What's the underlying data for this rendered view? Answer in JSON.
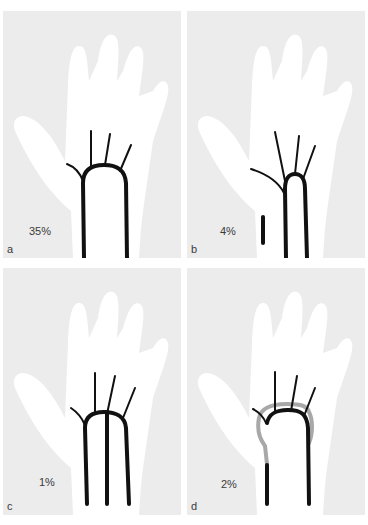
{
  "figure": {
    "panels": [
      {
        "letter": "a",
        "percentage": "35%",
        "variant": "complete superficial arch (ulnar + radial)"
      },
      {
        "letter": "b",
        "percentage": "4%",
        "variant": "ulnar arch with separate radial branch"
      },
      {
        "letter": "c",
        "percentage": "1%",
        "variant": "arch with median artery contribution"
      },
      {
        "letter": "d",
        "percentage": "2%",
        "variant": "arch with gray (deep/radial) overlapping loop"
      }
    ],
    "colors": {
      "background": "#ffffff",
      "panel_background": "#ececec",
      "hand_fill": "#ffffff",
      "vessel": "#111111",
      "vessel_secondary": "#a8a8a8",
      "label_text": "#3a3a3a"
    }
  }
}
